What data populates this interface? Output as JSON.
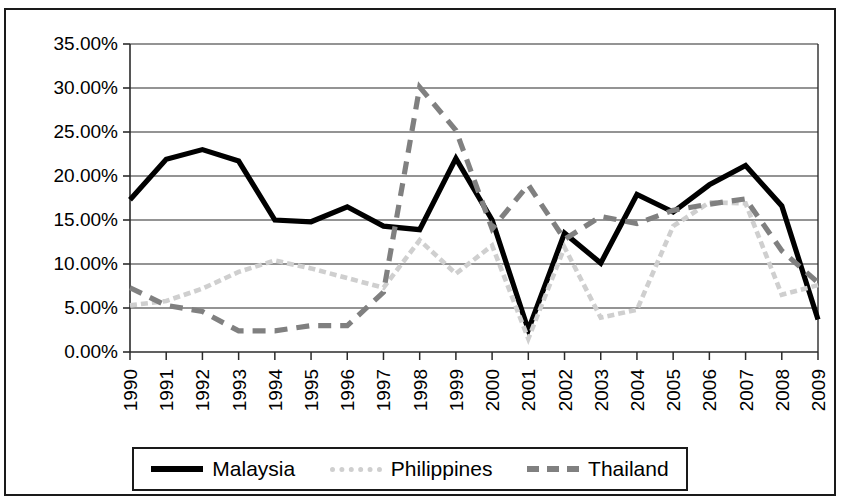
{
  "chart_data": {
    "type": "line",
    "title": "",
    "subtitle": "",
    "xlabel": "",
    "ylabel": "",
    "grid": "horizontal",
    "legend_position": "bottom",
    "ylim": [
      0,
      35
    ],
    "ytick_step": 5,
    "ytick_labels": [
      "0.00%",
      "5.00%",
      "10.00%",
      "15.00%",
      "20.00%",
      "25.00%",
      "30.00%",
      "35.00%"
    ],
    "ytick_values": [
      0,
      5,
      10,
      15,
      20,
      25,
      30,
      35
    ],
    "categories": [
      "1990",
      "1991",
      "1992",
      "1993",
      "1994",
      "1995",
      "1996",
      "1997",
      "1998",
      "1999",
      "2000",
      "2001",
      "2002",
      "2003",
      "2004",
      "2005",
      "2006",
      "2007",
      "2008",
      "2009"
    ],
    "value_unit": "%",
    "series": [
      {
        "name": "Malaysia",
        "color": "#000000",
        "style": "solid",
        "values": [
          17.3,
          21.9,
          23.0,
          21.7,
          15.0,
          14.8,
          16.5,
          14.3,
          13.9,
          22.0,
          15.0,
          2.5,
          13.5,
          10.1,
          17.9,
          15.9,
          19.0,
          21.2,
          16.6,
          3.7
        ]
      },
      {
        "name": "Philippines",
        "color": "#cfcfcf",
        "style": "dotted",
        "values": [
          5.3,
          5.8,
          7.2,
          9.1,
          10.4,
          9.5,
          8.4,
          7.3,
          12.7,
          8.9,
          12.1,
          1.5,
          11.9,
          3.9,
          4.8,
          14.3,
          17.0,
          16.9,
          6.5,
          7.6
        ]
      },
      {
        "name": "Thailand",
        "color": "#808080",
        "style": "dashed",
        "values": [
          7.3,
          5.3,
          4.6,
          2.4,
          2.4,
          3.0,
          3.0,
          6.8,
          30.1,
          25.2,
          14.0,
          19.0,
          12.8,
          15.4,
          14.6,
          16.1,
          16.8,
          17.4,
          11.5,
          7.9
        ]
      }
    ]
  },
  "legend": {
    "items": [
      {
        "label": "Malaysia",
        "swatch": "solid-black"
      },
      {
        "label": "Philippines",
        "swatch": "dashed-light"
      },
      {
        "label": "Thailand",
        "swatch": "dashed-dark"
      }
    ]
  }
}
